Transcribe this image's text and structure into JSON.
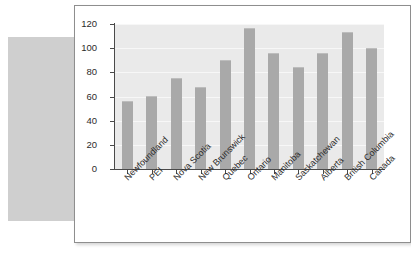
{
  "colors": {
    "bar": "#a9a9a9",
    "plot_background": "#eaeaea",
    "panel_background": "#ffffff",
    "panel_border": "#8e8e8e",
    "backdrop_block": "#cfcfcf",
    "axis": "#4a4a4a",
    "gridline": "#f7f7f7",
    "tick_text": "#2b2b2b"
  },
  "chart_data": {
    "type": "bar",
    "title": "",
    "subtitle": "",
    "xlabel": "",
    "ylabel": "",
    "ylim": [
      0,
      120
    ],
    "yticks": [
      0,
      20,
      40,
      60,
      80,
      100,
      120
    ],
    "ytick_labels": [
      "0",
      "20",
      "40",
      "60",
      "80",
      "100",
      "120"
    ],
    "grid": true,
    "grid_axis": "y",
    "legend": false,
    "legend_position": "none",
    "categories": [
      "Newfoundland",
      "PEI",
      "Nova Scotia",
      "New Brunswick",
      "Quebec",
      "Ontario",
      "Manitoba",
      "Saskatchewan",
      "Alberta",
      "British Columbia",
      "Canada"
    ],
    "values": [
      56,
      60.5,
      75.5,
      67.5,
      90,
      116.5,
      96,
      84.5,
      96,
      113,
      100
    ],
    "xtick_label_rotation": -45
  }
}
